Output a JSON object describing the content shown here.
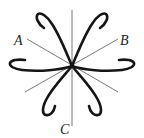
{
  "diagram": {
    "center": [
      72,
      66
    ],
    "labels": {
      "a": "A",
      "b": "B",
      "c": "C"
    },
    "colors": {
      "lines": "#6a6a6a",
      "curves": "#151515",
      "text": "#222222",
      "background": "#ffffff"
    }
  }
}
